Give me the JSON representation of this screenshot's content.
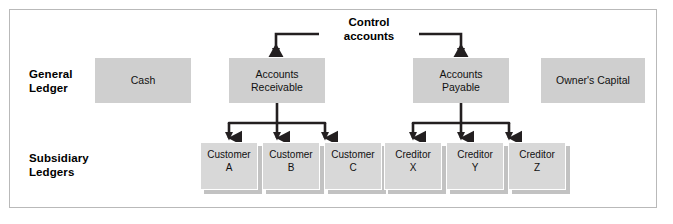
{
  "diagram": {
    "colors": {
      "frame_border": "#b9b9b9",
      "gl_box_fill": "#cfcfcf",
      "sub_card_fill": "#d8d8d8",
      "sub_card_shadow": "#c2c2c2",
      "connector": "#231f20",
      "text": "#111111",
      "background": "#ffffff"
    }
  },
  "rows": {
    "general_ledger": {
      "label": "General\nLedger"
    },
    "subsidiary_ledgers": {
      "label": "Subsidiary\nLedgers"
    }
  },
  "annotations": {
    "control_accounts": "Control\naccounts"
  },
  "general_ledger_accounts": [
    {
      "id": "cash",
      "label": "Cash",
      "x": 95,
      "y": 58,
      "width": 96,
      "height": 45,
      "has_control_arrow": false,
      "has_subsidiary": false
    },
    {
      "id": "accounts-receivable",
      "label": "Accounts\nReceivable",
      "x": 229,
      "y": 58,
      "width": 96,
      "height": 45,
      "has_control_arrow": true,
      "has_subsidiary": true
    },
    {
      "id": "accounts-payable",
      "label": "Accounts\nPayable",
      "x": 413,
      "y": 58,
      "width": 96,
      "height": 45,
      "has_control_arrow": true,
      "has_subsidiary": true
    },
    {
      "id": "owners-capital",
      "label": "Owner's Capital",
      "x": 541,
      "y": 58,
      "width": 104,
      "height": 45,
      "has_control_arrow": false,
      "has_subsidiary": false
    }
  ],
  "subsidiary_ledger_cards": [
    {
      "id": "customer-a",
      "label": "Customer\nA",
      "parent": "accounts-receivable",
      "x": 200,
      "y": 142
    },
    {
      "id": "customer-b",
      "label": "Customer\nB",
      "parent": "accounts-receivable",
      "x": 262,
      "y": 142
    },
    {
      "id": "customer-c",
      "label": "Customer\nC",
      "parent": "accounts-receivable",
      "x": 324,
      "y": 142
    },
    {
      "id": "creditor-x",
      "label": "Creditor\nX",
      "parent": "accounts-payable",
      "x": 384,
      "y": 142
    },
    {
      "id": "creditor-y",
      "label": "Creditor\nY",
      "parent": "accounts-payable",
      "x": 446,
      "y": 142
    },
    {
      "id": "creditor-z",
      "label": "Creditor\nZ",
      "parent": "accounts-payable",
      "x": 508,
      "y": 142
    }
  ]
}
